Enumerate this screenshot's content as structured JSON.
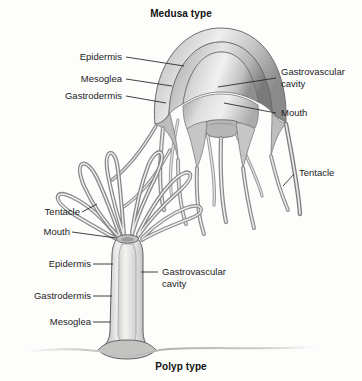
{
  "figure": {
    "titles": {
      "top": "Medusa type",
      "bottom": "Polyp type"
    },
    "labels": {
      "medusa_left": [
        {
          "text": "Epidermis"
        },
        {
          "text": "Mesoglea"
        },
        {
          "text": "Gastrodermis"
        }
      ],
      "medusa_right": [
        {
          "text": "Gastrovascular cavity"
        },
        {
          "text": "Mouth"
        },
        {
          "text": "Tentacle"
        }
      ],
      "polyp_left": [
        {
          "text": "Tentacle"
        },
        {
          "text": "Mouth"
        },
        {
          "text": "Epidermis"
        },
        {
          "text": "Gastrodermis"
        },
        {
          "text": "Mesoglea"
        }
      ],
      "polyp_right": [
        {
          "text": "Gastrovascular cavity"
        }
      ]
    },
    "colors": {
      "background": "#fdfdfc",
      "text": "#1c1c1c",
      "title_text": "#111111",
      "leader_line": "#2b2b2b",
      "tissue_dark": "#6f6f6f",
      "tissue_mid": "#a8a8a8",
      "tissue_light": "#d8d8d8",
      "tissue_pale": "#efefed",
      "outline": "#565656"
    }
  }
}
